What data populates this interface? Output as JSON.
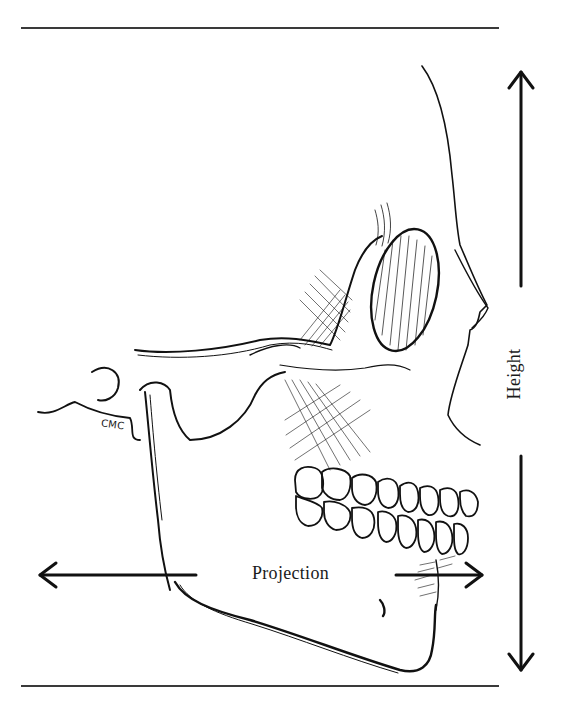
{
  "figure": {
    "line_color": "#111111",
    "rule_color": "#3a3a3a",
    "background": "#ffffff"
  },
  "labels": {
    "projection": "Projection",
    "height": "Height",
    "cmc": "CMC"
  },
  "arrows": {
    "height": {
      "orientation": "vertical",
      "direction": "bidirectional",
      "x": 521,
      "y_top": 70,
      "y_bottom": 672
    },
    "projection": {
      "orientation": "horizontal",
      "direction": "bidirectional",
      "y": 575,
      "x_left": 38,
      "x_right": 483
    }
  }
}
